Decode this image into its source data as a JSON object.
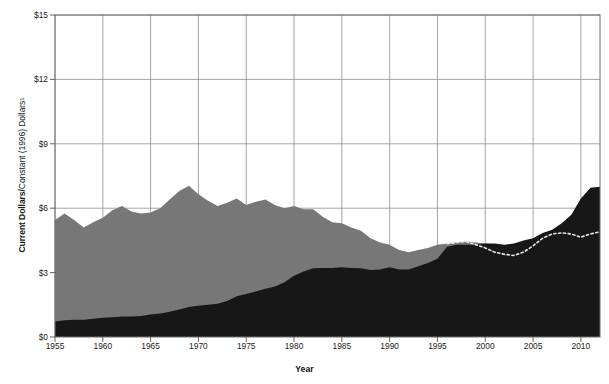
{
  "chart_data": {
    "type": "area",
    "title": "",
    "subtitle": "",
    "xlabel": "Year",
    "ylabel": "Current Dollars / Constant (1996) Dollars",
    "ylabel_parts": {
      "bold": "Current Dollars",
      "separator": " / ",
      "regular": "Constant (1996) Dollars",
      "footnote": "1"
    },
    "xlim": [
      1955,
      2012
    ],
    "ylim": [
      0,
      15
    ],
    "grid": true,
    "legend_position": "none",
    "x_tick_labels": [
      "1955",
      "1960",
      "1965",
      "1970",
      "1975",
      "1980",
      "1985",
      "1990",
      "1995",
      "2000",
      "2005",
      "2010"
    ],
    "x_tick_values": [
      1955,
      1960,
      1965,
      1970,
      1975,
      1980,
      1985,
      1990,
      1995,
      2000,
      2005,
      2010
    ],
    "y_tick_labels": [
      "$0",
      "$3",
      "$6",
      "$9",
      "$12",
      "$15"
    ],
    "y_tick_values": [
      0,
      3,
      6,
      9,
      12,
      15
    ],
    "colors": {
      "constant_dollars_area": "#777777",
      "current_dollars_area": "#171717",
      "dotted_overlay": "#e8e8e8",
      "gridline": "#8d8d8d",
      "axis": "#555555",
      "text": "#1b1b1b"
    },
    "x": [
      1955,
      1956,
      1957,
      1958,
      1959,
      1960,
      1961,
      1962,
      1963,
      1964,
      1965,
      1966,
      1967,
      1968,
      1969,
      1970,
      1971,
      1972,
      1973,
      1974,
      1975,
      1976,
      1977,
      1978,
      1979,
      1980,
      1981,
      1982,
      1983,
      1984,
      1985,
      1986,
      1987,
      1988,
      1989,
      1990,
      1991,
      1992,
      1993,
      1994,
      1995,
      1996,
      1997,
      1998,
      1999,
      2000,
      2001,
      2002,
      2003,
      2004,
      2005,
      2006,
      2007,
      2008,
      2009,
      2010,
      2011,
      2012
    ],
    "series": [
      {
        "name": "Constant (1996) Dollars",
        "style": "area",
        "color": "#777777",
        "values": [
          5.45,
          5.75,
          5.45,
          5.1,
          5.35,
          5.55,
          5.9,
          6.1,
          5.85,
          5.75,
          5.8,
          6.0,
          6.4,
          6.8,
          7.05,
          6.65,
          6.35,
          6.1,
          6.25,
          6.45,
          6.15,
          6.3,
          6.4,
          6.15,
          6.0,
          6.1,
          5.95,
          5.95,
          5.6,
          5.35,
          5.3,
          5.1,
          4.95,
          4.6,
          4.4,
          4.3,
          4.05,
          3.95,
          4.05,
          4.15,
          4.3,
          4.35,
          4.4,
          4.45,
          4.4,
          4.35,
          4.3,
          4.15,
          4.1,
          4.2,
          4.35,
          4.55,
          4.6,
          4.85,
          5.2,
          5.95,
          6.55,
          6.85
        ]
      },
      {
        "name": "Current Dollars",
        "style": "area",
        "color": "#171717",
        "values": [
          0.72,
          0.78,
          0.8,
          0.8,
          0.85,
          0.9,
          0.92,
          0.95,
          0.95,
          0.98,
          1.05,
          1.1,
          1.18,
          1.28,
          1.4,
          1.45,
          1.5,
          1.55,
          1.68,
          1.9,
          2.0,
          2.12,
          2.25,
          2.35,
          2.55,
          2.85,
          3.05,
          3.2,
          3.22,
          3.22,
          3.25,
          3.22,
          3.2,
          3.12,
          3.15,
          3.25,
          3.15,
          3.15,
          3.3,
          3.45,
          3.65,
          4.2,
          4.3,
          4.3,
          4.3,
          4.35,
          4.35,
          4.3,
          4.35,
          4.5,
          4.6,
          4.85,
          5.0,
          5.3,
          5.7,
          6.45,
          6.95,
          7.0
        ]
      },
      {
        "name": "Dotted overlay",
        "style": "dotted-line",
        "color": "#e8e8e8",
        "x": [
          1996,
          1997,
          1998,
          1999,
          2000,
          2001,
          2002,
          2003,
          2004,
          2005,
          2006,
          2007,
          2008,
          2009,
          2010,
          2011,
          2012
        ],
        "values": [
          4.35,
          4.4,
          4.45,
          4.3,
          4.15,
          3.95,
          3.85,
          3.8,
          3.95,
          4.25,
          4.6,
          4.8,
          4.85,
          4.8,
          4.65,
          4.8,
          4.9
        ]
      }
    ]
  }
}
